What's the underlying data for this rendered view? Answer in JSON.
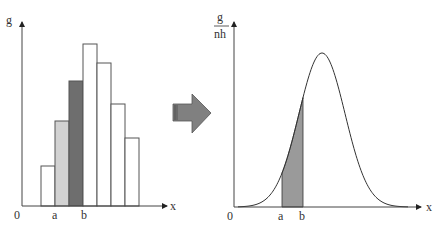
{
  "left_chart": {
    "y_label": "g",
    "x_label": "x",
    "origin_label": "0",
    "a_label": "a",
    "b_label": "b",
    "bars": [
      {
        "x": 41,
        "top": 166,
        "fill": "#ffffff"
      },
      {
        "x": 55,
        "top": 121,
        "fill": "#d2d2d2"
      },
      {
        "x": 69,
        "top": 81,
        "fill": "#6e6e6e"
      },
      {
        "x": 83,
        "top": 44,
        "fill": "#ffffff"
      },
      {
        "x": 97,
        "top": 63,
        "fill": "#ffffff"
      },
      {
        "x": 111,
        "top": 104,
        "fill": "#ffffff"
      },
      {
        "x": 125,
        "top": 138,
        "fill": "#ffffff"
      }
    ]
  },
  "right_chart": {
    "y_label_num": "g",
    "y_label_den": "nh",
    "x_label": "x",
    "origin_label": "0",
    "a_label": "a",
    "b_label": "b",
    "shade_color": "#9a9a9a"
  },
  "arrow": {
    "color": "#808080"
  },
  "chart_data": [
    {
      "type": "bar",
      "title": "",
      "xlabel": "x",
      "ylabel": "g",
      "categories": [
        "1",
        "2",
        "3",
        "4",
        "5",
        "6",
        "7"
      ],
      "values": [
        1.0,
        2.1,
        3.1,
        4.0,
        3.5,
        2.5,
        1.7
      ],
      "highlighted": {
        "a_to_mid": 2,
        "mid_to_b": 3
      },
      "x_ticks": [
        "0",
        "a",
        "b"
      ],
      "grid": false
    },
    {
      "type": "line",
      "title": "",
      "xlabel": "x",
      "ylabel": "g/nh",
      "description": "bell-shaped normal density curve with area between a and b shaded",
      "x_ticks": [
        "0",
        "a",
        "b"
      ],
      "shaded_interval": [
        "a",
        "b"
      ],
      "grid": false
    }
  ]
}
